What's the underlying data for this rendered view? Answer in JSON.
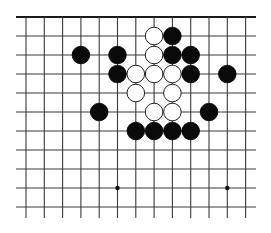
{
  "board": {
    "type": "go-board-partial",
    "columns": 13,
    "rows": 11,
    "origin_x": 26,
    "origin_y": 17,
    "col_spacing": 18.3,
    "row_spacing": 19,
    "line_left_x": 16,
    "line_right_x": 256,
    "line_bottom_y": 218,
    "top_edge": true,
    "colors": {
      "line": "#3a3a3a",
      "black": "#0a0a0a",
      "white": "#ffffff",
      "background": "#ffffff"
    },
    "star_points": [
      {
        "col": 5,
        "row": 9
      },
      {
        "col": 11,
        "row": 9
      }
    ],
    "stones": [
      {
        "color": "white",
        "col": 7,
        "row": 1
      },
      {
        "color": "black",
        "col": 8,
        "row": 1
      },
      {
        "color": "black",
        "col": 3,
        "row": 2
      },
      {
        "color": "black",
        "col": 5,
        "row": 2
      },
      {
        "color": "white",
        "col": 7,
        "row": 2
      },
      {
        "color": "black",
        "col": 8,
        "row": 2
      },
      {
        "color": "black",
        "col": 9,
        "row": 2
      },
      {
        "color": "black",
        "col": 5,
        "row": 3
      },
      {
        "color": "white",
        "col": 6,
        "row": 3
      },
      {
        "color": "white",
        "col": 7,
        "row": 3
      },
      {
        "color": "white",
        "col": 8,
        "row": 3
      },
      {
        "color": "black",
        "col": 9,
        "row": 3
      },
      {
        "color": "black",
        "col": 11,
        "row": 3
      },
      {
        "color": "white",
        "col": 6,
        "row": 4
      },
      {
        "color": "white",
        "col": 8,
        "row": 4
      },
      {
        "color": "black",
        "col": 4,
        "row": 5
      },
      {
        "color": "white",
        "col": 7,
        "row": 5
      },
      {
        "color": "white",
        "col": 8,
        "row": 5
      },
      {
        "color": "black",
        "col": 10,
        "row": 5
      },
      {
        "color": "black",
        "col": 6,
        "row": 6
      },
      {
        "color": "black",
        "col": 7,
        "row": 6
      },
      {
        "color": "black",
        "col": 8,
        "row": 6
      },
      {
        "color": "black",
        "col": 9,
        "row": 6
      }
    ]
  }
}
